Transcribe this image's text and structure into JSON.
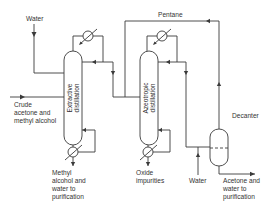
{
  "diagram": {
    "type": "process-flow",
    "units": {
      "extractive_column": {
        "line1": "Extractive",
        "line2": "distillation"
      },
      "azeotropic_column": {
        "line1": "Azeotropic",
        "line2": "distillation"
      },
      "decanter": "Decanter"
    },
    "streams": {
      "water_in_top": "Water",
      "pentane_recycle": "Pentane",
      "feed": [
        "Crude",
        "acetone and",
        "methyl alcohol"
      ],
      "extractive_bottoms": [
        "Methyl",
        "alcohol and",
        "water to",
        "purification"
      ],
      "azeotropic_bottoms": [
        "Oxide",
        "impurities"
      ],
      "water_in_decanter": "Water",
      "decanter_product": [
        "Acetone and",
        "water to",
        "purification"
      ]
    },
    "colors": {
      "line": "#3a3a3a",
      "text": "#333333",
      "background": "#ffffff"
    }
  }
}
